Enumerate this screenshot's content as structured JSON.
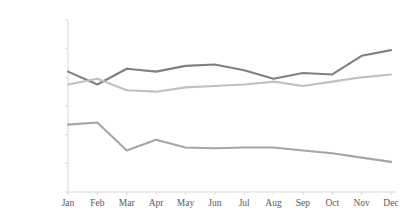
{
  "chart_data": {
    "type": "line",
    "title": "",
    "subtitle": "",
    "xlabel": "",
    "ylabel": "",
    "categories": [
      "Jan",
      "Feb",
      "Mar",
      "Apr",
      "May",
      "Jun",
      "Jul",
      "Aug",
      "Sep",
      "Oct",
      "Nov",
      "Dec"
    ],
    "ylim": [
      0,
      120000
    ],
    "yticks": [
      0,
      20000,
      40000,
      60000,
      80000,
      100000,
      120000
    ],
    "ytick_labels": [
      "0",
      "20,000",
      "40,000",
      "60,000",
      "80,000",
      "100,000",
      "120,000"
    ],
    "grid": false,
    "legend": "none",
    "series": [
      {
        "name": "series-1",
        "color": "#808080",
        "values": [
          84000,
          75000,
          86000,
          84000,
          88000,
          89000,
          85000,
          79000,
          83000,
          82000,
          95000,
          99000
        ]
      },
      {
        "name": "series-2",
        "color": "#c0c0c0",
        "values": [
          75000,
          79000,
          71000,
          70000,
          73000,
          74000,
          75000,
          77000,
          74000,
          77000,
          80000,
          82000
        ]
      },
      {
        "name": "series-3",
        "color": "#a6a6a6",
        "values": [
          47000,
          48500,
          29000,
          36500,
          31000,
          30500,
          31000,
          31000,
          29000,
          27000,
          24000,
          21000
        ]
      }
    ]
  },
  "axis": {
    "line_color": "#d9d9d9",
    "tick_color": "#d9d9d9",
    "label_color": "#595959"
  },
  "geometry": {
    "plot_left": 68,
    "plot_right": 391,
    "plot_top": 20,
    "plot_bottom": 192,
    "xtick_label_y": 198
  }
}
